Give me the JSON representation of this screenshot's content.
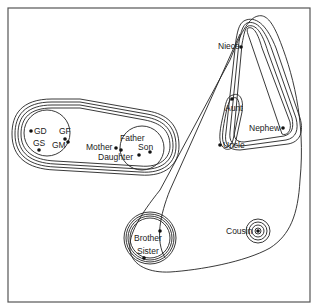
{
  "diagram": {
    "type": "nested-cluster-contours",
    "background": "#ffffff",
    "line_color": "#222222",
    "clusters": [
      {
        "id": "grandparents",
        "members": [
          "GD",
          "GS",
          "GF",
          "GM"
        ],
        "contours": 1
      },
      {
        "id": "parents-children",
        "members": [
          "Mother",
          "Father",
          "Daughter",
          "Son"
        ],
        "contours": 1
      },
      {
        "id": "lineal",
        "members": [
          "GD",
          "GS",
          "GF",
          "GM",
          "Mother",
          "Father",
          "Daughter",
          "Son"
        ],
        "contours": 4
      },
      {
        "id": "aunt-uncle",
        "members": [
          "Aunt",
          "Uncle"
        ],
        "contours": 2
      },
      {
        "id": "niece-nephew",
        "members": [
          "Niece",
          "Nephew"
        ],
        "contours": 1
      },
      {
        "id": "collateral-gen",
        "members": [
          "Niece",
          "Nephew",
          "Aunt",
          "Uncle"
        ],
        "contours": 3
      },
      {
        "id": "siblings",
        "members": [
          "Brother",
          "Sister"
        ],
        "contours": 4
      },
      {
        "id": "cousin",
        "members": [
          "Cousin"
        ],
        "contours": 4
      },
      {
        "id": "collateral",
        "members": [
          "Niece",
          "Nephew",
          "Aunt",
          "Uncle",
          "Brother",
          "Sister",
          "Cousin"
        ],
        "contours": 1
      }
    ],
    "labels": {
      "gd": "GD",
      "gs": "GS",
      "gf": "GF",
      "gm": "GM",
      "mother": "Mother",
      "father": "Father",
      "daughter": "Daughter",
      "son": "Son",
      "niece": "Niece",
      "nephew": "Nephew",
      "aunt": "Aunt",
      "uncle": "Uncle",
      "brother": "Brother",
      "sister": "Sister",
      "cousin": "Cousin"
    }
  }
}
